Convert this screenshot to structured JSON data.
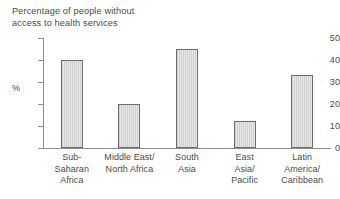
{
  "chart_data": {
    "type": "bar",
    "title": "Percentage of people without\naccess to health services",
    "xlabel": "",
    "ylabel": "%",
    "ylim": [
      0,
      50
    ],
    "yticks": [
      0,
      10,
      20,
      30,
      40,
      50
    ],
    "ytick_labels": [
      "0",
      "10",
      "20",
      "30",
      "40",
      "50"
    ],
    "grid": false,
    "legend": "none",
    "categories": [
      "Sub-\nSaharan\nAfrica",
      "Middle East/\nNorth Africa",
      "South\nAsia",
      "East\nAsia/\nPacific",
      "Latin\nAmerica/\nCaribbean"
    ],
    "values": [
      40,
      20,
      45,
      12.5,
      33
    ],
    "bar_fill_color": "#d9d9d9",
    "bar_edge_color": "#6d6d6d",
    "axis_color": "#8e8e8e",
    "text_color": "#4a4a4a",
    "background_color": "#ffffff"
  }
}
